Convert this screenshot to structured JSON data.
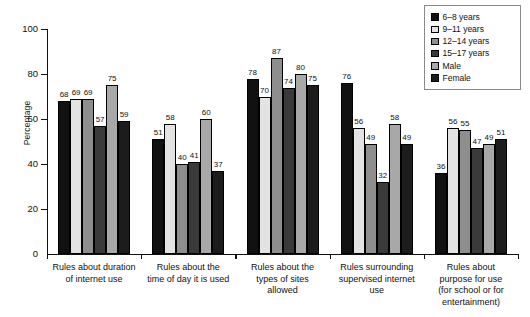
{
  "chart_data": {
    "type": "bar",
    "title": "",
    "subtitle": "",
    "xlabel": "",
    "ylabel": "Percentage",
    "ylim": [
      0,
      100
    ],
    "yticks": [
      0,
      20,
      40,
      60,
      80,
      100
    ],
    "grid": false,
    "legend_position": "top-right",
    "value_labels": true,
    "categories": [
      "Rules about duration of internet use",
      "Rules about the time of day it is used",
      "Rules about the types of sites allowed",
      "Rules surrounding supervised internet use",
      "Rules about purpose for use (for school or for entertainment)"
    ],
    "category_lines": [
      [
        "Rules about duration",
        "of internet use"
      ],
      [
        "Rules about the",
        "time of day it is used"
      ],
      [
        "Rules about the",
        "types of sites",
        "allowed"
      ],
      [
        "Rules surrounding",
        "supervised internet",
        "use"
      ],
      [
        "Rules about",
        "purpose for use",
        "(for school or for",
        "entertainment)"
      ]
    ],
    "series": [
      {
        "name": "6–8 years",
        "color": "#111111",
        "values": [
          68,
          51,
          78,
          76,
          36
        ]
      },
      {
        "name": "9–11 years",
        "color": "#e3e3e3",
        "values": [
          69,
          58,
          70,
          56,
          56
        ]
      },
      {
        "name": "12–14 years",
        "color": "#8e8e8e",
        "values": [
          69,
          40,
          87,
          49,
          55
        ]
      },
      {
        "name": "15–17 years",
        "color": "#3a3a3a",
        "values": [
          57,
          41,
          74,
          32,
          47
        ]
      },
      {
        "name": "Male",
        "color": "#a8a8a8",
        "values": [
          75,
          60,
          80,
          58,
          49
        ]
      },
      {
        "name": "Female",
        "color": "#1c1c1c",
        "values": [
          59,
          37,
          75,
          49,
          51
        ]
      }
    ]
  }
}
